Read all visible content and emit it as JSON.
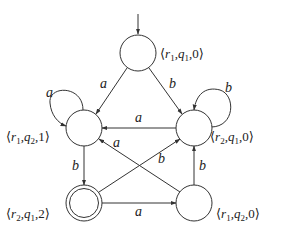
{
  "diagram": {
    "type": "finite-automaton",
    "nodes": [
      {
        "id": "n0",
        "label": "⟨r1,q1,0⟩",
        "r": "r",
        "r_sub": "1",
        "q": "q",
        "q_sub": "1",
        "k": "0",
        "initial": true,
        "accepting": false
      },
      {
        "id": "n1",
        "label": "⟨r1,q2,1⟩",
        "r": "r",
        "r_sub": "1",
        "q": "q",
        "q_sub": "2",
        "k": "1",
        "initial": false,
        "accepting": false
      },
      {
        "id": "n2",
        "label": "⟨r2,q1,0⟩",
        "r": "r",
        "r_sub": "2",
        "q": "q",
        "q_sub": "1",
        "k": "0",
        "initial": false,
        "accepting": false
      },
      {
        "id": "n3",
        "label": "⟨r2,q1,2⟩",
        "r": "r",
        "r_sub": "2",
        "q": "q",
        "q_sub": "1",
        "k": "2",
        "initial": false,
        "accepting": true
      },
      {
        "id": "n4",
        "label": "⟨r1,q2,0⟩",
        "r": "r",
        "r_sub": "1",
        "q": "q",
        "q_sub": "2",
        "k": "0",
        "initial": false,
        "accepting": false
      }
    ],
    "edges": [
      {
        "from": "n0",
        "to": "n1",
        "label": "a"
      },
      {
        "from": "n0",
        "to": "n2",
        "label": "b"
      },
      {
        "from": "n1",
        "to": "n1",
        "label": "a"
      },
      {
        "from": "n2",
        "to": "n2",
        "label": "b"
      },
      {
        "from": "n2",
        "to": "n1",
        "label": "a"
      },
      {
        "from": "n4",
        "to": "n1",
        "label": "a"
      },
      {
        "from": "n3",
        "to": "n2",
        "label": "b"
      },
      {
        "from": "n1",
        "to": "n3",
        "label": "b"
      },
      {
        "from": "n4",
        "to": "n2",
        "label": "b"
      },
      {
        "from": "n3",
        "to": "n4",
        "label": "a"
      }
    ]
  }
}
